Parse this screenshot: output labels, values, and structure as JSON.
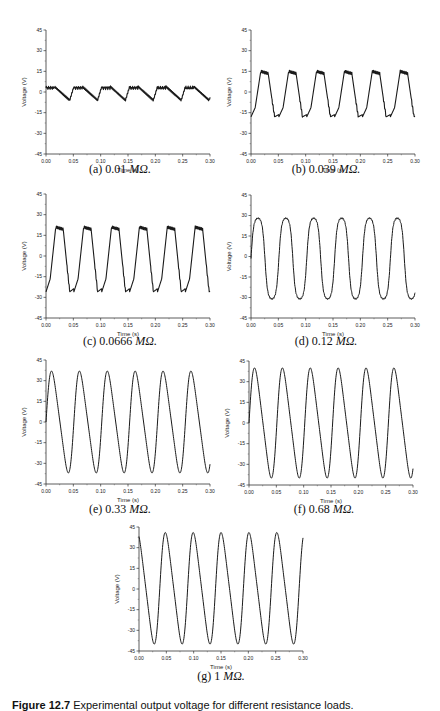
{
  "figure": {
    "label": "Figure 12.7",
    "caption": "Experimental output voltage for different resistance loads."
  },
  "chart_data": [
    {
      "id": "a",
      "type": "line",
      "caption_prefix": "(a) 0.01 ",
      "caption_unit": "MΩ.",
      "xlabel": "Time (s)",
      "ylabel": "Voltage (V)",
      "xlim": [
        0.0,
        0.3
      ],
      "ylim": [
        -45,
        45
      ],
      "xticks": [
        "0.00",
        "0.05",
        "0.10",
        "0.15",
        "0.20",
        "0.25",
        "0.30"
      ],
      "yticks": [
        "45",
        "30",
        "15",
        "0",
        "-15",
        "-30",
        "-45"
      ],
      "period_s": 0.051,
      "phase_s": 0.0,
      "shape": "sawtooth",
      "max_v": 4,
      "min_v": -6,
      "x": [
        0.0,
        0.005,
        0.025,
        0.045,
        0.06,
        0.076,
        0.096,
        0.112,
        0.127,
        0.147,
        0.163,
        0.178,
        0.198,
        0.214,
        0.229,
        0.25,
        0.265,
        0.28,
        0.3
      ],
      "y": [
        3,
        3,
        -6,
        4,
        3,
        -6,
        4,
        3,
        -6,
        4,
        3,
        -6,
        4,
        3,
        -6,
        4,
        3,
        -6,
        0
      ]
    },
    {
      "id": "b",
      "type": "line",
      "caption_prefix": "(b) 0.039 ",
      "caption_unit": "MΩ.",
      "xlabel": "Time (s)",
      "ylabel": "Voltage (V)",
      "xlim": [
        0.0,
        0.3
      ],
      "ylim": [
        -45,
        45
      ],
      "xticks": [
        "0.00",
        "0.05",
        "0.10",
        "0.15",
        "0.20",
        "0.25",
        "0.30"
      ],
      "yticks": [
        "45",
        "30",
        "15",
        "0",
        "-15",
        "-30",
        "-45"
      ],
      "period_s": 0.051,
      "phase_s": 0.0,
      "shape": "square-ish",
      "max_v": 15,
      "min_v": -18,
      "x": [
        0.0,
        0.015,
        0.033,
        0.045,
        0.066,
        0.084,
        0.096,
        0.117,
        0.135,
        0.147,
        0.168,
        0.186,
        0.198,
        0.219,
        0.237,
        0.249,
        0.27,
        0.288,
        0.3
      ],
      "y": [
        0,
        -18,
        15,
        12,
        -18,
        15,
        12,
        -18,
        15,
        12,
        -18,
        15,
        12,
        -18,
        15,
        12,
        -18,
        15,
        12
      ]
    },
    {
      "id": "c",
      "type": "line",
      "caption_prefix": "(c) 0.0666 ",
      "caption_unit": "MΩ.",
      "xlabel": "Time (s)",
      "ylabel": "Voltage (V)",
      "xlim": [
        0.0,
        0.3
      ],
      "ylim": [
        -45,
        45
      ],
      "xticks": [
        "0.00",
        "0.05",
        "0.10",
        "0.15",
        "0.20",
        "0.25",
        "0.30"
      ],
      "yticks": [
        "45",
        "30",
        "15",
        "0",
        "-15",
        "-30",
        "-45"
      ],
      "period_s": 0.051,
      "phase_s": 0.0,
      "shape": "square-ish",
      "max_v": 21,
      "min_v": -26,
      "x": [
        0.0,
        0.013,
        0.032,
        0.045,
        0.064,
        0.083,
        0.096,
        0.115,
        0.134,
        0.147,
        0.166,
        0.185,
        0.198,
        0.217,
        0.236,
        0.249,
        0.268,
        0.287,
        0.3
      ],
      "y": [
        -8,
        -26,
        21,
        21,
        -26,
        21,
        21,
        -26,
        21,
        21,
        -26,
        21,
        21,
        -26,
        21,
        21,
        -26,
        21,
        19
      ]
    },
    {
      "id": "d",
      "type": "line",
      "caption_prefix": "(d) 0.12 ",
      "caption_unit": "MΩ.",
      "xlabel": "Time (s)",
      "ylabel": "Voltage (V)",
      "xlim": [
        0.0,
        0.3
      ],
      "ylim": [
        -45,
        45
      ],
      "xticks": [
        "0.00",
        "0.05",
        "0.10",
        "0.15",
        "0.20",
        "0.25",
        "0.30"
      ],
      "yticks": [
        "45",
        "30",
        "15",
        "0",
        "-15",
        "-30",
        "-45"
      ],
      "period_s": 0.051,
      "phase_s": 0.0,
      "shape": "rounded",
      "max_v": 28,
      "min_v": -31,
      "x": [
        0.0,
        0.013,
        0.045,
        0.064,
        0.096,
        0.115,
        0.147,
        0.166,
        0.198,
        0.217,
        0.249,
        0.268,
        0.3
      ],
      "y": [
        -5,
        -31,
        28,
        -31,
        28,
        -31,
        28,
        -31,
        28,
        -31,
        28,
        -31,
        26
      ]
    },
    {
      "id": "e",
      "type": "line",
      "caption_prefix": "(e) 0.33 ",
      "caption_unit": "MΩ.",
      "xlabel": "Time (s)",
      "ylabel": "Voltage (V)",
      "xlim": [
        0.0,
        0.3
      ],
      "ylim": [
        -45,
        45
      ],
      "xticks": [
        "0.00",
        "0.05",
        "0.10",
        "0.15",
        "0.20",
        "0.25",
        "0.30"
      ],
      "yticks": [
        "45",
        "30",
        "15",
        "0",
        "-15",
        "-30",
        "-45"
      ],
      "period_s": 0.051,
      "phase_s": 0.0,
      "shape": "skewed",
      "max_v": 37,
      "min_v": -37,
      "x": [
        0.0,
        0.022,
        0.045,
        0.073,
        0.096,
        0.124,
        0.147,
        0.175,
        0.198,
        0.226,
        0.249,
        0.277,
        0.3
      ],
      "y": [
        -5,
        37,
        -37,
        37,
        -37,
        37,
        -37,
        37,
        -37,
        37,
        -37,
        37,
        -35
      ]
    },
    {
      "id": "f",
      "type": "line",
      "caption_prefix": "(f) 0.68 ",
      "caption_unit": "MΩ.",
      "xlabel": "Time (s)",
      "ylabel": "Voltage (V)",
      "xlim": [
        0.0,
        0.3
      ],
      "ylim": [
        -45,
        45
      ],
      "xticks": [
        "0.00",
        "0.05",
        "0.10",
        "0.15",
        "0.20",
        "0.25",
        "0.30"
      ],
      "yticks": [
        "45",
        "30",
        "15",
        "0",
        "-15",
        "-30",
        "-45"
      ],
      "period_s": 0.051,
      "phase_s": 0.0,
      "shape": "skewed",
      "max_v": 40,
      "min_v": -40,
      "x": [
        0.0,
        0.024,
        0.049,
        0.075,
        0.1,
        0.126,
        0.151,
        0.177,
        0.202,
        0.228,
        0.253,
        0.279,
        0.3
      ],
      "y": [
        -28,
        40,
        -40,
        40,
        -40,
        40,
        -40,
        40,
        -40,
        40,
        -40,
        40,
        -28
      ]
    },
    {
      "id": "g",
      "type": "line",
      "caption_prefix": "(g) 1 ",
      "caption_unit": "MΩ.",
      "xlabel": "Time (s)",
      "ylabel": "Voltage (V)",
      "xlim": [
        0.0,
        0.3
      ],
      "ylim": [
        -45,
        45
      ],
      "xticks": [
        "0.00",
        "0.05",
        "0.10",
        "0.15",
        "0.20",
        "0.25",
        "0.30"
      ],
      "yticks": [
        "45",
        "30",
        "15",
        "0",
        "-15",
        "-30",
        "-45"
      ],
      "period_s": 0.051,
      "phase_s": -0.013,
      "shape": "skewed",
      "max_v": 41,
      "min_v": -40,
      "x": [
        0.0,
        0.012,
        0.036,
        0.063,
        0.087,
        0.114,
        0.138,
        0.165,
        0.189,
        0.216,
        0.24,
        0.267,
        0.291,
        0.3
      ],
      "y": [
        25,
        41,
        -40,
        41,
        -40,
        41,
        -40,
        41,
        -40,
        41,
        -40,
        41,
        -40,
        -37
      ]
    }
  ],
  "layout": {
    "panels": [
      {
        "id": "a",
        "ax_left": 46,
        "ax_top": 30,
        "ax_w": 164,
        "ax_h": 124,
        "cap_x": 20,
        "cap_y": 162,
        "cap_w": 200
      },
      {
        "id": "b",
        "ax_left": 251,
        "ax_top": 30,
        "ax_w": 164,
        "ax_h": 124,
        "cap_x": 226,
        "cap_y": 162,
        "cap_w": 200
      },
      {
        "id": "c",
        "ax_left": 46,
        "ax_top": 194,
        "ax_w": 164,
        "ax_h": 124,
        "cap_x": 20,
        "cap_y": 334,
        "cap_w": 200
      },
      {
        "id": "d",
        "ax_left": 251,
        "ax_top": 195,
        "ax_w": 164,
        "ax_h": 123,
        "cap_x": 226,
        "cap_y": 334,
        "cap_w": 200
      },
      {
        "id": "e",
        "ax_left": 46,
        "ax_top": 360,
        "ax_w": 164,
        "ax_h": 124,
        "cap_x": 20,
        "cap_y": 502,
        "cap_w": 200
      },
      {
        "id": "f",
        "ax_left": 249,
        "ax_top": 361,
        "ax_w": 164,
        "ax_h": 124,
        "cap_x": 224,
        "cap_y": 502,
        "cap_w": 200
      },
      {
        "id": "g",
        "ax_left": 139,
        "ax_top": 527,
        "ax_w": 164,
        "ax_h": 124,
        "cap_x": 121,
        "cap_y": 669,
        "cap_w": 200
      }
    ]
  }
}
